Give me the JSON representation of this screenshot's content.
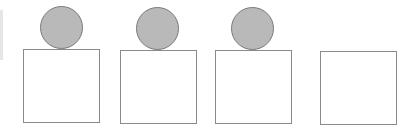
{
  "diagram": {
    "ball_color": "#b9b9b9",
    "ball_border": "#7a7a7a",
    "box_border": "#8a8a8a",
    "items": [
      {
        "box": {
          "left": 23,
          "top": 49
        },
        "ball": {
          "left": 40,
          "top": 6
        },
        "has_ball": true
      },
      {
        "box": {
          "left": 120,
          "top": 50
        },
        "ball": {
          "left": 136,
          "top": 7
        },
        "has_ball": true
      },
      {
        "box": {
          "left": 215,
          "top": 50
        },
        "ball": {
          "left": 231,
          "top": 7
        },
        "has_ball": true
      },
      {
        "box": {
          "left": 320,
          "top": 51
        },
        "ball": null,
        "has_ball": false
      }
    ]
  }
}
